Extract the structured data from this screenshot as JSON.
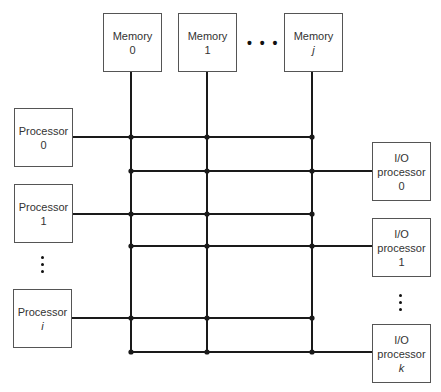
{
  "diagram": {
    "type": "crossbar-switch",
    "memories": [
      {
        "label": "Memory",
        "index": "0",
        "italic": false
      },
      {
        "label": "Memory",
        "index": "1",
        "italic": false
      },
      {
        "label": "Memory",
        "index": "j",
        "italic": true
      }
    ],
    "processors": [
      {
        "label": "Processor",
        "index": "0",
        "italic": false
      },
      {
        "label": "Processor",
        "index": "1",
        "italic": false
      },
      {
        "label": "Processor",
        "index": "i",
        "italic": true
      }
    ],
    "io_processors": [
      {
        "label_line1": "I/O",
        "label_line2": "processor",
        "index": "0",
        "italic": false
      },
      {
        "label_line1": "I/O",
        "label_line2": "processor",
        "index": "1",
        "italic": false
      },
      {
        "label_line1": "I/O",
        "label_line2": "processor",
        "index": "k",
        "italic": true
      }
    ],
    "ellipsis_horizontal": "• • •",
    "line_color": "#1a1a1a"
  }
}
